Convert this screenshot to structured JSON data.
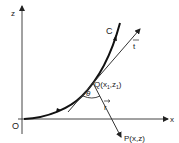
{
  "diagram": {
    "axes": {
      "z_label": "z",
      "x_label": "x",
      "origin_label": "O"
    },
    "curve": {
      "label": "C"
    },
    "tangent": {
      "label": "t"
    },
    "point_q": {
      "label": "Q(x",
      "sub1": "1",
      "mid": ",z",
      "sub2": "1",
      "end": ")"
    },
    "angle": {
      "label": "θ"
    },
    "vector_r": {
      "label": "r"
    },
    "point_p": {
      "label": "P(x,z)"
    },
    "colors": {
      "ink": "#222222",
      "background": "#ffffff"
    }
  }
}
